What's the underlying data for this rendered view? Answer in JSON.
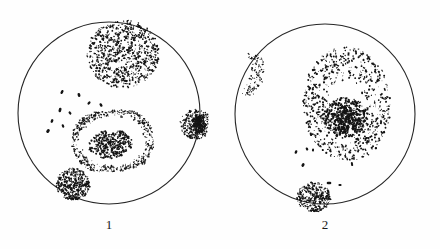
{
  "figure": {
    "caption_left": "1",
    "caption_right": "2",
    "background_color": "#fefefe",
    "ink_color": "#141414",
    "outline_color": "#262626",
    "bleed_through_top": "",
    "bleed_through_mid": "",
    "bleed_through_bottom": ""
  },
  "chart_data": {
    "type": "scatter",
    "title": "",
    "xlabel": "",
    "ylabel": "",
    "grid": false,
    "legend": "none",
    "panels": [
      {
        "label": "1",
        "field": {
          "cx": 109,
          "cy": 113,
          "r": 91,
          "stroke": "#262626",
          "stroke_width": 1.1
        },
        "caption_x": 109,
        "caption_y": 228,
        "patches": [
          {
            "name": "upper-dense-oval",
            "shape": "ellipse",
            "cx": 123,
            "cy": 54,
            "rx": 36,
            "ry": 34,
            "rotate": -12,
            "fill_style": "dense-coarse",
            "dot_count": 820,
            "dot_min": 0.7,
            "dot_max": 2.0,
            "density_profile": "uniform-heavy",
            "core": null
          },
          {
            "name": "mid-ringed-blob",
            "shape": "rounded-rect-blob",
            "cx": 113,
            "cy": 141,
            "rx": 40,
            "ry": 30,
            "rotate": -6,
            "fill_style": "ring-plus-core",
            "dot_count": 560,
            "dot_min": 0.6,
            "dot_max": 1.7,
            "density_profile": "ring-outline",
            "core": {
              "cx": 110,
              "cy": 144,
              "rx": 22,
              "ry": 14,
              "dot_count": 300,
              "dot_max": 2.2
            }
          },
          {
            "name": "lower-left-dark-blob",
            "shape": "ellipse",
            "cx": 73,
            "cy": 184,
            "rx": 17,
            "ry": 16,
            "rotate": 8,
            "fill_style": "dense-coarse",
            "dot_count": 340,
            "dot_min": 0.8,
            "dot_max": 2.1,
            "density_profile": "uniform-heavy",
            "core": null
          },
          {
            "name": "right-edge-blob",
            "shape": "ellipse",
            "cx": 196,
            "cy": 124,
            "rx": 16,
            "ry": 15,
            "rotate": 0,
            "fill_style": "stipple-with-dark-center",
            "dot_count": 260,
            "dot_min": 0.7,
            "dot_max": 2.0,
            "density_profile": "edge-sparse-center-dark",
            "core": {
              "cx": 199,
              "cy": 123,
              "rx": 7,
              "ry": 9,
              "dot_count": 150,
              "dot_max": 2.4
            }
          }
        ],
        "dashes": [
          {
            "x": 62,
            "y": 92,
            "w": 2.4,
            "h": 4.2,
            "rotate": 25
          },
          {
            "x": 79,
            "y": 95,
            "w": 2.6,
            "h": 4.0,
            "rotate": -15
          },
          {
            "x": 89,
            "y": 103,
            "w": 2.2,
            "h": 3.6,
            "rotate": 40
          },
          {
            "x": 101,
            "y": 105,
            "w": 2.4,
            "h": 3.8,
            "rotate": -30
          },
          {
            "x": 60,
            "y": 110,
            "w": 2.6,
            "h": 4.4,
            "rotate": 15
          },
          {
            "x": 70,
            "y": 113,
            "w": 2.2,
            "h": 3.4,
            "rotate": -35
          },
          {
            "x": 52,
            "y": 121,
            "w": 2.4,
            "h": 3.8,
            "rotate": 20
          },
          {
            "x": 63,
            "y": 126,
            "w": 2.2,
            "h": 3.6,
            "rotate": -20
          },
          {
            "x": 48,
            "y": 131,
            "w": 2.8,
            "h": 4.2,
            "rotate": 35
          }
        ]
      },
      {
        "label": "2",
        "field": {
          "cx": 325,
          "cy": 114,
          "r": 90,
          "stroke": "#262626",
          "stroke_width": 1.1
        },
        "caption_x": 325,
        "caption_y": 228,
        "patches": [
          {
            "name": "large-ringed-colony",
            "shape": "ellipse",
            "cx": 347,
            "cy": 104,
            "rx": 43,
            "ry": 56,
            "rotate": -4,
            "fill_style": "sparse-ring-plus-dense-core",
            "dot_count": 700,
            "dot_min": 0.6,
            "dot_max": 2.2,
            "density_profile": "sparse-outer",
            "core": {
              "cx": 345,
              "cy": 117,
              "rx": 21,
              "ry": 20,
              "dot_count": 560,
              "dot_max": 2.3
            }
          },
          {
            "name": "left-edge-crescent",
            "shape": "crescent",
            "cx": 250,
            "cy": 75,
            "rx": 13,
            "ry": 22,
            "rotate": 18,
            "fill_style": "medium-stipple",
            "dot_count": 230,
            "dot_min": 0.6,
            "dot_max": 1.6,
            "density_profile": "uniform-medium",
            "core": null
          },
          {
            "name": "bottom-edge-blob",
            "shape": "ellipse",
            "cx": 314,
            "cy": 197,
            "rx": 17,
            "ry": 15,
            "rotate": 0,
            "fill_style": "dense-coarse",
            "dot_count": 300,
            "dot_min": 0.7,
            "dot_max": 2.0,
            "density_profile": "uniform-heavy",
            "core": null
          }
        ],
        "dashes": [
          {
            "x": 296,
            "y": 152,
            "w": 2.4,
            "h": 3.6,
            "rotate": 20
          },
          {
            "x": 307,
            "y": 149,
            "w": 2.2,
            "h": 3.2,
            "rotate": -25
          },
          {
            "x": 313,
            "y": 150,
            "w": 2.0,
            "h": 3.0,
            "rotate": 10
          },
          {
            "x": 303,
            "y": 165,
            "w": 2.6,
            "h": 3.8,
            "rotate": 30
          },
          {
            "x": 352,
            "y": 164,
            "w": 2.0,
            "h": 4.2,
            "rotate": -10
          },
          {
            "x": 329,
            "y": 183,
            "w": 4.6,
            "h": 2.6,
            "rotate": 0
          },
          {
            "x": 340,
            "y": 185,
            "w": 3.2,
            "h": 2.2,
            "rotate": 0
          }
        ]
      }
    ]
  }
}
